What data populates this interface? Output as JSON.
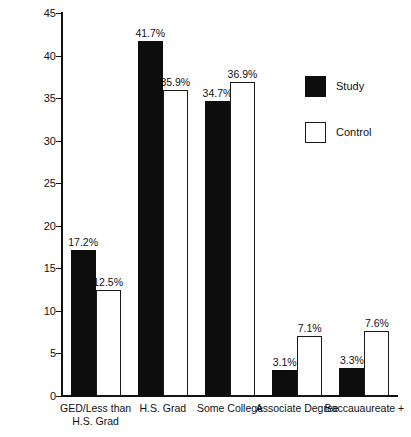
{
  "chart_data": {
    "type": "bar",
    "title": "",
    "subtitle": "",
    "xlabel": "",
    "ylabel": "",
    "ylim": [
      0,
      45
    ],
    "yticks": [
      0,
      5,
      10,
      15,
      20,
      25,
      30,
      35,
      40,
      45
    ],
    "ytick_labels": [
      "0",
      "5",
      "10",
      "15",
      "20",
      "25",
      "30",
      "35",
      "40",
      "45"
    ],
    "grid": false,
    "legend_position": "upper right",
    "categories": [
      "GED/Less than H.S. Grad",
      "H.S. Grad",
      "Some College",
      "Associate Degree",
      "Baccauaureate +"
    ],
    "category_label_lines": [
      [
        "GED/Less than",
        "H.S. Grad"
      ],
      [
        "H.S. Grad"
      ],
      [
        "Some College"
      ],
      [
        "Associate Degree"
      ],
      [
        "Baccauaureate +"
      ]
    ],
    "series": [
      {
        "name": "Study",
        "color": "#0d0d0d",
        "values": [
          17.2,
          41.7,
          34.7,
          3.1,
          3.3
        ],
        "data_labels": [
          "17.2%",
          "41.7%",
          "34.7%",
          "3.1%",
          "3.3%"
        ]
      },
      {
        "name": "Control",
        "color": "#ffffff",
        "values": [
          12.5,
          35.9,
          36.9,
          7.1,
          7.6
        ],
        "data_labels": [
          "12.5%",
          "35.9%",
          "36.9%",
          "7.1%",
          "7.6%"
        ]
      }
    ]
  },
  "legend": {
    "items": [
      {
        "label": "Study",
        "swatch": "filled-black-square"
      },
      {
        "label": "Control",
        "swatch": "outlined-white-square"
      }
    ]
  }
}
